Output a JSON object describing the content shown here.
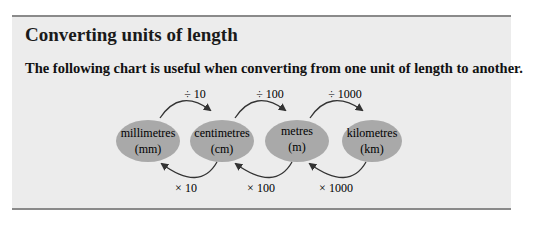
{
  "panel": {
    "title": "Converting units of length",
    "intro": "The following chart is useful when converting from one unit of length to another."
  },
  "units": [
    {
      "name": "millimetres",
      "abbr": "(mm)"
    },
    {
      "name": "centimetres",
      "abbr": "(cm)"
    },
    {
      "name": "metres",
      "abbr": "(m)"
    },
    {
      "name": "kilometres",
      "abbr": "(km)"
    }
  ],
  "divide_arrows": [
    {
      "label": "÷ 10",
      "from": "mm",
      "to": "cm"
    },
    {
      "label": "÷ 100",
      "from": "cm",
      "to": "m"
    },
    {
      "label": "÷ 1000",
      "from": "m",
      "to": "km"
    }
  ],
  "multiply_arrows": [
    {
      "label": "× 10",
      "from": "cm",
      "to": "mm"
    },
    {
      "label": "× 100",
      "from": "m",
      "to": "cm"
    },
    {
      "label": "× 1000",
      "from": "km",
      "to": "m"
    }
  ],
  "colors": {
    "panel_bg": "#ececec",
    "rule": "#8a8a8a",
    "ellipse_fill": "#a9a9a9",
    "arrow": "#333333"
  }
}
